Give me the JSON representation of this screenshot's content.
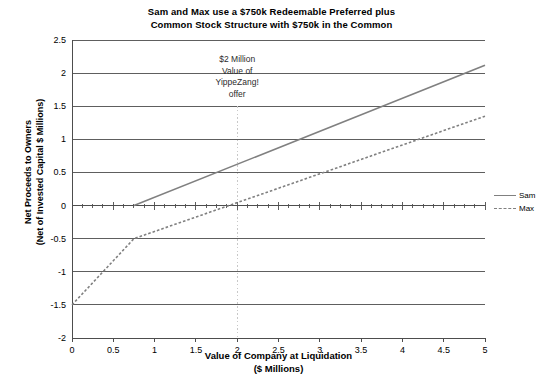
{
  "chart_data": {
    "type": "line",
    "title": "Sam and Max use a $750k Redeemable Preferred plus Common Stock Structure with $750k in the Common",
    "title_lines": [
      "Sam and Max use a $750k Redeemable Preferred plus",
      "Common Stock Structure with $750k in the Common"
    ],
    "xlabel": "Value of Company at Liquidation ($ Millions)",
    "xlabel_lines": [
      "Value of Company at Liquidation",
      "($ Millions)"
    ],
    "ylabel": "Net Proceeds to Owners (Net of Invested Capital $ Millions)",
    "ylabel_lines": [
      "Net Proceeds to Owners",
      "(Net of Invested Capital $ Millions)"
    ],
    "xlim": [
      0,
      5
    ],
    "ylim": [
      -2,
      2.5
    ],
    "xticks": [
      0,
      0.5,
      1,
      1.5,
      2,
      2.5,
      3,
      3.5,
      4,
      4.5,
      5
    ],
    "xtick_labels": [
      "0",
      "0.5",
      "1",
      "1.5",
      "2",
      "2.5",
      "3",
      "3.5",
      "4",
      "4.5",
      "5"
    ],
    "yticks": [
      2.5,
      2,
      1.5,
      1,
      0.5,
      0,
      -0.5,
      -1,
      -1.5,
      -2
    ],
    "ytick_labels": [
      "2.5",
      "2",
      "1.5",
      "1",
      "0.5",
      "0",
      "-0.5",
      "-1",
      "-1.5",
      "-2"
    ],
    "grid": "horizontal",
    "legend_position": "right",
    "series": [
      {
        "name": "Sam",
        "style": "solid",
        "color": "#808080",
        "points": [
          [
            0,
            0
          ],
          [
            0.75,
            0
          ],
          [
            5,
            2.12
          ]
        ]
      },
      {
        "name": "Max",
        "style": "dashed",
        "color": "#808080",
        "points": [
          [
            0,
            -1.5
          ],
          [
            0.75,
            -0.5
          ],
          [
            5,
            1.35
          ]
        ]
      }
    ],
    "annotations": [
      {
        "name": "yippezang-offer-marker",
        "text": "$2 Million Value of YippeZang! offer",
        "text_lines": [
          "$2 Million",
          "Value of",
          "YippeZang!",
          "offer"
        ],
        "x": 2,
        "marker_style": "dotted-vertical",
        "marker_color": "#c8c8c8",
        "marker_y_top": 1.5,
        "marker_y_bottom": -2
      }
    ],
    "colors": {
      "grid": "#4d4d4d",
      "axis": "#4d4d4d",
      "series": "#808080",
      "annotation_line": "#c8c8c8",
      "text": "#000000",
      "background": "#ffffff"
    }
  },
  "legend": {
    "items": [
      {
        "label": "Sam",
        "style": "solid"
      },
      {
        "label": "Max",
        "style": "dashed"
      }
    ]
  }
}
